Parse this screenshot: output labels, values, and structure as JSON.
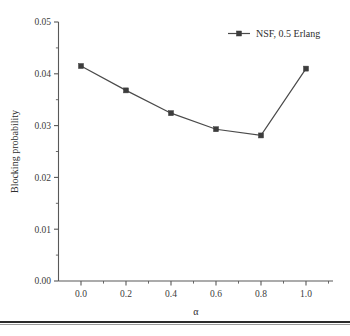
{
  "chart_data": {
    "type": "line",
    "title": "",
    "xlabel": "α",
    "ylabel": "Blocking probability",
    "xlim": [
      -0.1,
      1.12
    ],
    "ylim": [
      0.0,
      0.05
    ],
    "grid": false,
    "legend_position": "top-right",
    "x": [
      0.0,
      0.2,
      0.4,
      0.6,
      0.8,
      1.0
    ],
    "xticks": [
      "0.0",
      "0.2",
      "0.4",
      "0.6",
      "0.8",
      "1.0"
    ],
    "xtick_values": [
      0.0,
      0.2,
      0.4,
      0.6,
      0.8,
      1.0
    ],
    "xminor_values": [
      0.1,
      0.3,
      0.5,
      0.7,
      0.9,
      1.1
    ],
    "yticks": [
      "0.00",
      "0.01",
      "0.02",
      "0.03",
      "0.04",
      "0.05"
    ],
    "ytick_values": [
      0.0,
      0.01,
      0.02,
      0.03,
      0.04,
      0.05
    ],
    "yminor_values": [
      0.005,
      0.015,
      0.025,
      0.035,
      0.045
    ],
    "marker": "square",
    "line_color": "#4a4a4a",
    "marker_color": "#3d3d3d",
    "series": [
      {
        "name": "NSF, 0.5 Erlang",
        "values": [
          0.0415,
          0.0368,
          0.0324,
          0.0293,
          0.0281,
          0.041
        ]
      }
    ]
  },
  "legend": {
    "entries": [
      {
        "label": "NSF, 0.5 Erlang"
      }
    ]
  },
  "axes": {
    "y_title": "Blocking probability",
    "x_title": "α"
  }
}
